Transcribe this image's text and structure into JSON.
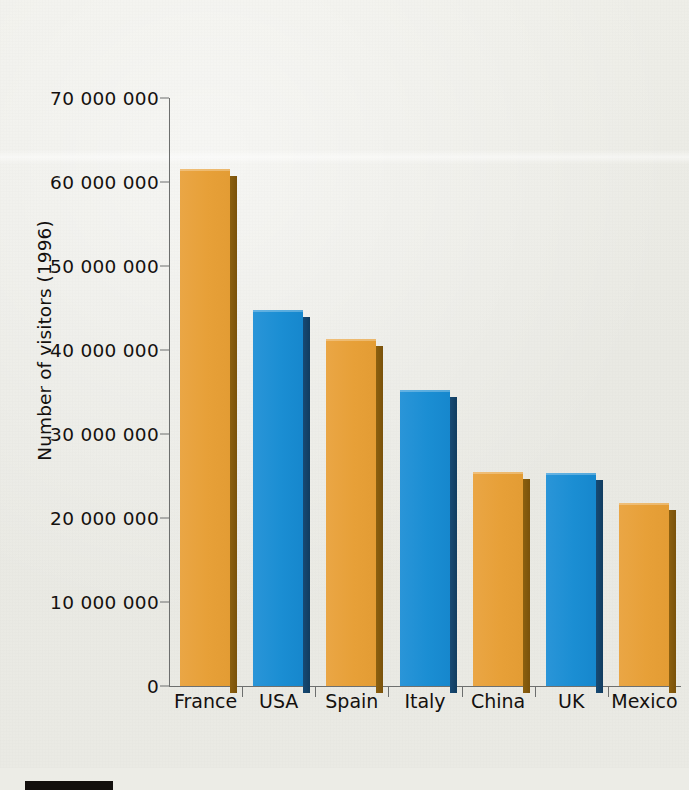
{
  "chart_data": {
    "type": "bar",
    "title": "",
    "xlabel": "",
    "ylabel": "Number of visitors (1996)",
    "categories": [
      "France",
      "USA",
      "Spain",
      "Italy",
      "China",
      "UK",
      "Mexico"
    ],
    "values": [
      61500000,
      44800000,
      41300000,
      35200000,
      25500000,
      25300000,
      21800000
    ],
    "series": [
      {
        "name": "Number of visitors (1996)",
        "values": [
          61500000,
          44800000,
          41300000,
          35200000,
          25500000,
          25300000,
          21800000
        ]
      }
    ],
    "bar_colors": [
      "orange",
      "blue",
      "orange",
      "blue",
      "orange",
      "blue",
      "orange"
    ],
    "ylim": [
      0,
      70000000
    ],
    "ytick_values": [
      0,
      10000000,
      20000000,
      30000000,
      40000000,
      50000000,
      60000000,
      70000000
    ],
    "ytick_labels": [
      "0",
      "10 000 000",
      "20 000 000",
      "30 000 000",
      "40 000 000",
      "50 000 000",
      "60 000 000",
      "70 000 000"
    ],
    "grid": false,
    "legend": null,
    "legend_position": "none"
  },
  "colors": {
    "orange": "#e7a038",
    "orange_shadow": "#8c600f",
    "blue": "#1b8ed3",
    "blue_shadow": "#174a74",
    "axis": "#6d6f6e",
    "text": "#14110f",
    "paper": "#e9e9e3",
    "rule": "#120f0d"
  }
}
